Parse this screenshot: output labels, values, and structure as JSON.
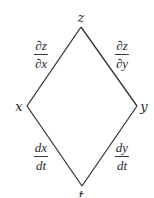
{
  "diagram": {
    "type": "tree",
    "nodes": {
      "top": {
        "label": "z",
        "x": 81,
        "y": 17
      },
      "left": {
        "label": "x",
        "x": 19,
        "y": 106
      },
      "right": {
        "label": "y",
        "x": 144,
        "y": 106
      },
      "bottom": {
        "label": "t",
        "x": 81,
        "y": 194
      }
    },
    "vertices": {
      "top": [
        81,
        27
      ],
      "left": [
        27,
        106
      ],
      "right": [
        137,
        106
      ],
      "bottom": [
        82,
        186
      ]
    },
    "edges": [
      {
        "from": "top",
        "to": "left",
        "label": {
          "numerator": "∂z",
          "denominator": "∂x"
        }
      },
      {
        "from": "top",
        "to": "right",
        "label": {
          "numerator": "∂z",
          "denominator": "∂y"
        }
      },
      {
        "from": "left",
        "to": "bottom",
        "label": {
          "numerator": "dx",
          "denominator": "dt"
        }
      },
      {
        "from": "right",
        "to": "bottom",
        "label": {
          "numerator": "dy",
          "denominator": "dt"
        }
      }
    ],
    "colors": {
      "line": "#333333",
      "text": "#2a2a2a",
      "background": "#ffffff"
    }
  }
}
